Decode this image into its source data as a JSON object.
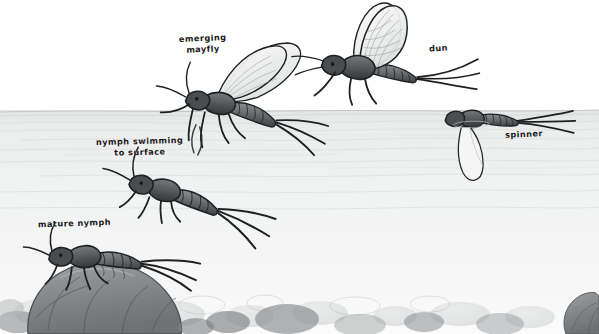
{
  "illustration": {
    "title": "Mayfly life cycle",
    "medium": "pencil sketch",
    "palette": {
      "background": "#ffffff",
      "water_top": "#e9eaea",
      "water_bottom": "#f4f5f5",
      "surface_line": "#c9cbcb",
      "ink": "#1a1a1a",
      "body_mid": "#6e7173",
      "body_dark": "#3b3d3f",
      "rock_fill": "#8e9092",
      "rock_light": "#cfd1d1",
      "wing_fill": "#f0f1f1"
    }
  },
  "labels": {
    "emerging_mayfly": "emerging\nmayfly",
    "nymph_swimming": "nymph swimming\nto surface",
    "dun": "dun",
    "spinner": "spinner",
    "mature_nymph": "mature nymph"
  },
  "stages": [
    {
      "name": "mature-nymph",
      "label": "mature nymph",
      "location": "clinging to streambed rock"
    },
    {
      "name": "nymph-swimming",
      "label": "nymph swimming to surface",
      "location": "mid-water, ascending"
    },
    {
      "name": "emerging-mayfly",
      "label": "emerging mayfly",
      "location": "at water surface, wings unfurling from shuck"
    },
    {
      "name": "dun",
      "label": "dun",
      "location": "on surface, wings upright"
    },
    {
      "name": "spinner",
      "label": "spinner",
      "location": "spent on surface, wings flat"
    }
  ]
}
